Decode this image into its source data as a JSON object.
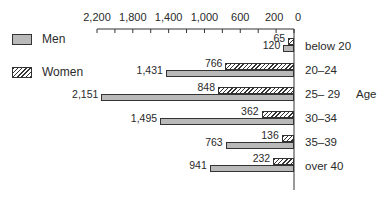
{
  "chart_data": {
    "type": "bar",
    "orientation": "horizontal",
    "direction": "right-to-left",
    "title": "",
    "xlabel": "",
    "ylabel": "Age",
    "categories": [
      "below 20",
      "20–24",
      "25– 29",
      "30–34",
      "35–39",
      "over 40"
    ],
    "series": [
      {
        "name": "Women",
        "pattern": "hatched",
        "values": [
          65,
          766,
          848,
          362,
          136,
          232
        ]
      },
      {
        "name": "Men",
        "pattern": "dotted",
        "values": [
          120,
          1431,
          2151,
          1495,
          763,
          941
        ]
      }
    ],
    "xlim": [
      0,
      2200
    ],
    "x_ticks": [
      0,
      200,
      400,
      600,
      800,
      1000,
      1200,
      1400,
      1600,
      1800,
      2000,
      2200
    ],
    "x_tick_labels": [
      "2,200",
      "1,800",
      "1,400",
      "1,000",
      "600",
      "200",
      "0"
    ],
    "grid": false,
    "legend_position": "left"
  },
  "legend": [
    {
      "label": "Men",
      "pattern": "dotted"
    },
    {
      "label": "Women",
      "pattern": "hatched"
    }
  ],
  "axis": {
    "title": "Age"
  },
  "value_labels": {
    "women": [
      "65",
      "766",
      "848",
      "362",
      "136",
      "232"
    ],
    "men": [
      "120",
      "1,431",
      "2,151",
      "1,495",
      "763",
      "941"
    ]
  }
}
